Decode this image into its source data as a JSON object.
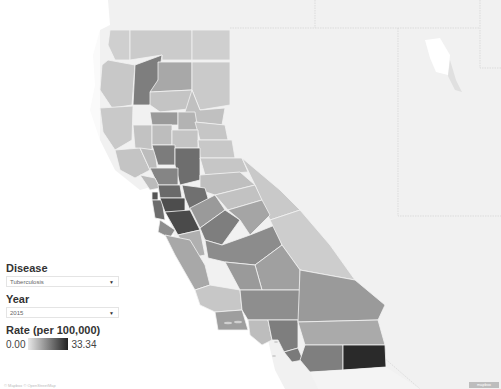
{
  "filters": {
    "disease_label": "Disease",
    "disease_value": "Tuberculosis",
    "year_label": "Year",
    "year_value": "2015"
  },
  "legend": {
    "title": "Rate (per 100,000)",
    "min": "0.00",
    "max": "33.34",
    "color_low": "#e8e8e8",
    "color_high": "#222222"
  },
  "map": {
    "region": "California counties",
    "color_scheme": "grayscale sequential"
  },
  "footer": {
    "credit": "© Mapbox © OpenStreetMap",
    "badge": "mapbox"
  }
}
